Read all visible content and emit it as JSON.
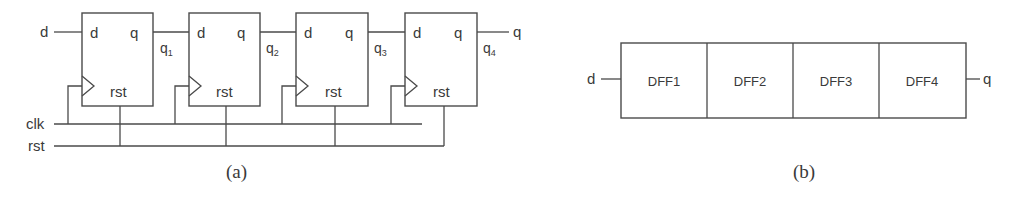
{
  "figure_a": {
    "caption": "(a)",
    "input_label": "d",
    "output_label": "q",
    "clk_label": "clk",
    "rst_label": "rst",
    "flip_flops": [
      {
        "d_port": "d",
        "q_port": "q",
        "rst_port": "rst",
        "output_net": "q",
        "output_sub": "1"
      },
      {
        "d_port": "d",
        "q_port": "q",
        "rst_port": "rst",
        "output_net": "q",
        "output_sub": "2"
      },
      {
        "d_port": "d",
        "q_port": "q",
        "rst_port": "rst",
        "output_net": "q",
        "output_sub": "3"
      },
      {
        "d_port": "d",
        "q_port": "q",
        "rst_port": "rst",
        "output_net": "q",
        "output_sub": "4"
      }
    ]
  },
  "figure_b": {
    "caption": "(b)",
    "input_label": "d",
    "output_label": "q",
    "cells": [
      "DFF1",
      "DFF2",
      "DFF3",
      "DFF4"
    ]
  },
  "colors": {
    "stroke": "#4a4a4a",
    "text": "#3a3a3a",
    "background": "#ffffff"
  }
}
